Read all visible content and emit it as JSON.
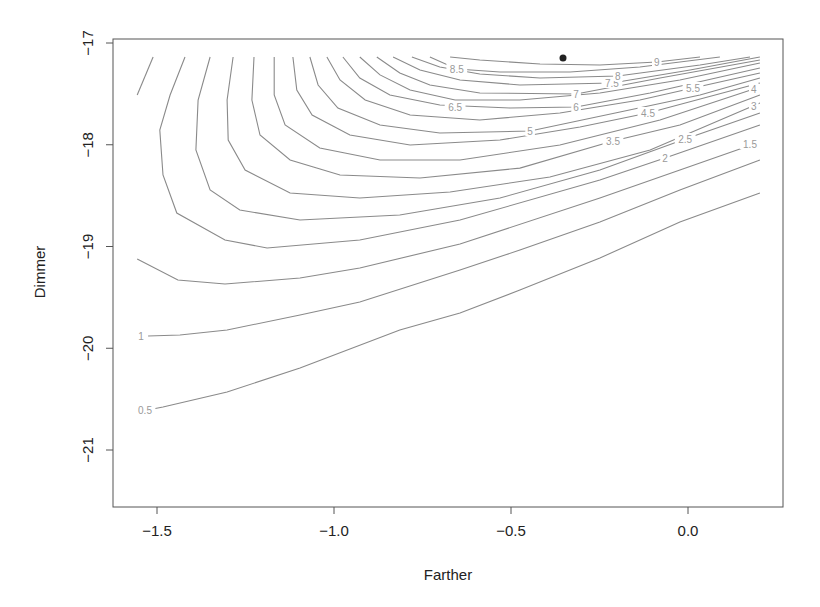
{
  "chart_data": {
    "type": "contour",
    "title": "",
    "xlabel": "Farther",
    "ylabel": "Dimmer",
    "xlim": [
      -1.625,
      0.268
    ],
    "ylim": [
      -21.56,
      -16.96
    ],
    "grid": false,
    "legend": null,
    "x_ticks": [
      -1.5,
      -1.0,
      -0.5,
      0.0
    ],
    "x_tick_labels": [
      "−1.5",
      "−1.0",
      "−0.5",
      "0.0"
    ],
    "y_ticks": [
      -17,
      -18,
      -19,
      -20,
      -21
    ],
    "y_tick_labels": [
      "−17",
      "−18",
      "−19",
      "−20",
      "−21"
    ],
    "levels": [
      0.5,
      1,
      1.5,
      2,
      2.5,
      3,
      3.5,
      4,
      4.5,
      5,
      5.5,
      6,
      6.5,
      7,
      7.5,
      8,
      8.5,
      9
    ],
    "maximum_point": {
      "x": -0.353,
      "y": -17.147
    },
    "contours": [
      {
        "level": 0.5,
        "points": [
          [
            -1.556,
            -20.627
          ],
          [
            -1.483,
            -20.577
          ],
          [
            -1.302,
            -20.43
          ],
          [
            -1.096,
            -20.194
          ],
          [
            -0.814,
            -19.821
          ],
          [
            -0.644,
            -19.654
          ],
          [
            -0.475,
            -19.428
          ],
          [
            -0.249,
            -19.113
          ],
          [
            -0.023,
            -18.759
          ],
          [
            0.203,
            -18.474
          ]
        ]
      },
      {
        "level": 1,
        "points": [
          [
            -1.525,
            -19.88
          ],
          [
            -1.435,
            -19.87
          ],
          [
            -1.302,
            -19.821
          ],
          [
            -1.096,
            -19.673
          ],
          [
            -0.927,
            -19.545
          ],
          [
            -0.644,
            -19.231
          ],
          [
            -0.475,
            -19.034
          ],
          [
            -0.249,
            -18.759
          ],
          [
            -0.023,
            -18.445
          ],
          [
            0.203,
            -18.15
          ]
        ]
      },
      {
        "level": 1.5,
        "points": [
          [
            -1.556,
            -19.123
          ],
          [
            -1.441,
            -19.329
          ],
          [
            -1.308,
            -19.369
          ],
          [
            -1.096,
            -19.31
          ],
          [
            -0.927,
            -19.211
          ],
          [
            -0.644,
            -18.975
          ],
          [
            -0.249,
            -18.523
          ],
          [
            -0.023,
            -18.248
          ],
          [
            0.203,
            -17.973
          ]
        ]
      },
      {
        "level": 1.5,
        "points": [
          [
            -1.511,
            -17.138
          ],
          [
            -1.556,
            -17.511
          ]
        ]
      },
      {
        "level": 2,
        "points": [
          [
            -1.421,
            -17.138
          ],
          [
            -1.463,
            -17.511
          ],
          [
            -1.492,
            -17.855
          ],
          [
            -1.483,
            -18.297
          ],
          [
            -1.444,
            -18.671
          ],
          [
            -1.308,
            -18.936
          ],
          [
            -1.189,
            -19.015
          ],
          [
            -0.927,
            -18.936
          ],
          [
            -0.644,
            -18.74
          ],
          [
            -0.249,
            -18.346
          ],
          [
            -0.065,
            -18.13
          ],
          [
            0.203,
            -17.806
          ]
        ]
      },
      {
        "level": 2.5,
        "points": [
          [
            -1.35,
            -17.138
          ],
          [
            -1.384,
            -17.56
          ],
          [
            -1.39,
            -18.052
          ],
          [
            -1.35,
            -18.445
          ],
          [
            -1.266,
            -18.641
          ],
          [
            -1.096,
            -18.74
          ],
          [
            -0.814,
            -18.69
          ],
          [
            -0.531,
            -18.523
          ],
          [
            -0.249,
            -18.248
          ],
          [
            -0.008,
            -17.943
          ],
          [
            0.203,
            -17.688
          ]
        ]
      },
      {
        "level": 3,
        "points": [
          [
            -1.285,
            -17.138
          ],
          [
            -1.302,
            -17.56
          ],
          [
            -1.299,
            -17.953
          ],
          [
            -1.251,
            -18.248
          ],
          [
            -1.124,
            -18.474
          ],
          [
            -0.927,
            -18.523
          ],
          [
            -0.672,
            -18.464
          ],
          [
            -0.39,
            -18.317
          ],
          [
            -0.107,
            -18.052
          ],
          [
            0.203,
            -17.59
          ]
        ]
      },
      {
        "level": 3.5,
        "points": [
          [
            -1.226,
            -17.138
          ],
          [
            -1.232,
            -17.56
          ],
          [
            -1.209,
            -17.904
          ],
          [
            -1.124,
            -18.15
          ],
          [
            -0.983,
            -18.297
          ],
          [
            -0.757,
            -18.327
          ],
          [
            -0.475,
            -18.229
          ],
          [
            -0.212,
            -17.963
          ],
          [
            -0.023,
            -17.806
          ],
          [
            0.203,
            -17.511
          ]
        ]
      },
      {
        "level": 4,
        "points": [
          [
            -1.169,
            -17.138
          ],
          [
            -1.169,
            -17.511
          ],
          [
            -1.138,
            -17.806
          ],
          [
            -1.04,
            -18.032
          ],
          [
            -0.87,
            -18.15
          ],
          [
            -0.644,
            -18.15
          ],
          [
            -0.362,
            -18.002
          ],
          [
            -0.079,
            -17.757
          ],
          [
            0.186,
            -17.452
          ]
        ]
      },
      {
        "level": 4.5,
        "points": [
          [
            -1.116,
            -17.138
          ],
          [
            -1.105,
            -17.462
          ],
          [
            -1.062,
            -17.708
          ],
          [
            -0.955,
            -17.904
          ],
          [
            -0.785,
            -18.002
          ],
          [
            -0.531,
            -17.953
          ],
          [
            -0.305,
            -17.826
          ],
          [
            -0.113,
            -17.688
          ],
          [
            0.203,
            -17.393
          ]
        ]
      },
      {
        "level": 5,
        "points": [
          [
            -1.068,
            -17.138
          ],
          [
            -1.045,
            -17.413
          ],
          [
            -0.989,
            -17.639
          ],
          [
            -0.87,
            -17.806
          ],
          [
            -0.701,
            -17.885
          ],
          [
            -0.446,
            -17.865
          ],
          [
            -0.192,
            -17.678
          ],
          [
            0.034,
            -17.511
          ],
          [
            0.203,
            -17.344
          ]
        ]
      },
      {
        "level": 5.5,
        "points": [
          [
            -1.02,
            -17.138
          ],
          [
            -0.983,
            -17.364
          ],
          [
            -0.912,
            -17.56
          ],
          [
            -0.785,
            -17.708
          ],
          [
            -0.588,
            -17.757
          ],
          [
            -0.362,
            -17.688
          ],
          [
            -0.136,
            -17.56
          ],
          [
            0.014,
            -17.442
          ],
          [
            0.203,
            -17.295
          ]
        ]
      },
      {
        "level": 6,
        "points": [
          [
            -0.975,
            -17.138
          ],
          [
            -0.927,
            -17.344
          ],
          [
            -0.842,
            -17.511
          ],
          [
            -0.701,
            -17.609
          ],
          [
            -0.503,
            -17.639
          ],
          [
            -0.316,
            -17.629
          ],
          [
            -0.107,
            -17.491
          ],
          [
            0.203,
            -17.246
          ]
        ]
      },
      {
        "level": 6.5,
        "points": [
          [
            -0.927,
            -17.138
          ],
          [
            -0.87,
            -17.314
          ],
          [
            -0.785,
            -17.462
          ],
          [
            -0.658,
            -17.56
          ],
          [
            -0.475,
            -17.56
          ],
          [
            -0.249,
            -17.491
          ],
          [
            -0.023,
            -17.364
          ],
          [
            0.203,
            -17.197
          ]
        ]
      },
      {
        "level": 7,
        "points": [
          [
            -0.879,
            -17.138
          ],
          [
            -0.814,
            -17.295
          ],
          [
            -0.729,
            -17.413
          ],
          [
            -0.588,
            -17.491
          ],
          [
            -0.316,
            -17.501
          ],
          [
            -0.079,
            -17.344
          ],
          [
            0.203,
            -17.167
          ]
        ]
      },
      {
        "level": 7.5,
        "points": [
          [
            -0.833,
            -17.138
          ],
          [
            -0.757,
            -17.265
          ],
          [
            -0.644,
            -17.364
          ],
          [
            -0.475,
            -17.413
          ],
          [
            -0.215,
            -17.393
          ],
          [
            0.006,
            -17.265
          ],
          [
            0.203,
            -17.138
          ]
        ]
      },
      {
        "level": 8,
        "points": [
          [
            -0.78,
            -17.138
          ],
          [
            -0.701,
            -17.236
          ],
          [
            -0.588,
            -17.305
          ],
          [
            -0.418,
            -17.344
          ],
          [
            -0.198,
            -17.324
          ],
          [
            0.034,
            -17.216
          ],
          [
            0.175,
            -17.138
          ]
        ]
      },
      {
        "level": 8.5,
        "points": [
          [
            -0.729,
            -17.138
          ],
          [
            -0.653,
            -17.256
          ],
          [
            -0.531,
            -17.285
          ],
          [
            -0.333,
            -17.285
          ],
          [
            -0.136,
            -17.236
          ],
          [
            0.09,
            -17.138
          ]
        ]
      },
      {
        "level": 9,
        "points": [
          [
            -0.672,
            -17.138
          ],
          [
            -0.588,
            -17.167
          ],
          [
            -0.418,
            -17.206
          ],
          [
            -0.249,
            -17.216
          ],
          [
            -0.088,
            -17.187
          ],
          [
            0.034,
            -17.138
          ]
        ]
      }
    ],
    "contour_labels": [
      {
        "text": "0.5",
        "x": -1.534,
        "y": -20.607
      },
      {
        "text": "1",
        "x": -1.545,
        "y": -19.88
      },
      {
        "text": "1.5",
        "x": 0.175,
        "y": -17.993
      },
      {
        "text": "2",
        "x": -0.065,
        "y": -18.13
      },
      {
        "text": "2.5",
        "x": -0.008,
        "y": -17.943
      },
      {
        "text": "3",
        "x": 0.186,
        "y": -17.619
      },
      {
        "text": "3.5",
        "x": -0.212,
        "y": -17.963
      },
      {
        "text": "4",
        "x": 0.186,
        "y": -17.452
      },
      {
        "text": "4.5",
        "x": -0.113,
        "y": -17.688
      },
      {
        "text": "5",
        "x": -0.446,
        "y": -17.865
      },
      {
        "text": "5.5",
        "x": 0.014,
        "y": -17.442
      },
      {
        "text": "6",
        "x": -0.316,
        "y": -17.629
      },
      {
        "text": "6.5",
        "x": -0.658,
        "y": -17.629
      },
      {
        "text": "7",
        "x": -0.316,
        "y": -17.501
      },
      {
        "text": "7.5",
        "x": -0.215,
        "y": -17.393
      },
      {
        "text": "8",
        "x": -0.198,
        "y": -17.324
      },
      {
        "text": "8.5",
        "x": -0.653,
        "y": -17.256
      },
      {
        "text": "9",
        "x": -0.088,
        "y": -17.187
      }
    ],
    "colors": {
      "contour": "#8a8a8a",
      "contour_label": "#9a9a9a",
      "axis": "#555555",
      "text": "#222222",
      "point": "#222222"
    }
  }
}
